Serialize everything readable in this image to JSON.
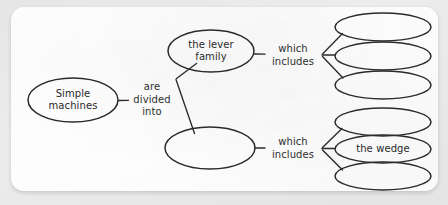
{
  "document": {
    "type": "concept-map-worksheet",
    "paper_color": "#fdfdfd",
    "ink_color": "#2a2a2a",
    "background_color": "#e9e9e9"
  },
  "diagram": {
    "root": {
      "id": "simple-machines",
      "label": "Simple\nmachines",
      "cx": 73,
      "cy": 100,
      "rx": 45,
      "ry": 22,
      "filled": true
    },
    "connectors": [
      {
        "id": "are-divided-into",
        "label": "are\ndivided\ninto",
        "x": 152,
        "y": 100,
        "align": "center"
      },
      {
        "id": "which-includes-top",
        "label": "which\nincludes",
        "x": 296,
        "y": 55,
        "align": "center"
      },
      {
        "id": "which-includes-bottom",
        "label": "which\nincludes",
        "x": 296,
        "y": 148,
        "align": "center"
      }
    ],
    "branches": [
      {
        "id": "lever-family",
        "label": "the lever\nfamily",
        "cx": 211,
        "cy": 51,
        "rx": 43,
        "ry": 21,
        "filled": true,
        "children": [
          {
            "id": "lever-child-1",
            "label": "",
            "cx": 383,
            "cy": 27,
            "rx": 48,
            "ry": 14,
            "filled": false
          },
          {
            "id": "lever-child-2",
            "label": "",
            "cx": 383,
            "cy": 56,
            "rx": 48,
            "ry": 14,
            "filled": false
          },
          {
            "id": "lever-child-3",
            "label": "",
            "cx": 383,
            "cy": 85,
            "rx": 48,
            "ry": 14,
            "filled": false
          }
        ]
      },
      {
        "id": "second-family",
        "label": "",
        "cx": 210,
        "cy": 148,
        "rx": 45,
        "ry": 21,
        "filled": false,
        "children": [
          {
            "id": "second-child-1",
            "label": "",
            "cx": 383,
            "cy": 122,
            "rx": 48,
            "ry": 14,
            "filled": false
          },
          {
            "id": "second-child-2",
            "label": "the wedge",
            "cx": 383,
            "cy": 149,
            "rx": 48,
            "ry": 14,
            "filled": true
          },
          {
            "id": "second-child-3",
            "label": "",
            "cx": 383,
            "cy": 176,
            "rx": 48,
            "ry": 14,
            "filled": false
          }
        ]
      }
    ]
  },
  "labels": {
    "simple_machines": "Simple\nmachines",
    "the_lever_family": "the lever\nfamily",
    "are_divided_into": "are\ndivided\ninto",
    "which_includes_top": "which\nincludes",
    "which_includes_bottom": "which\nincludes",
    "the_wedge": "the wedge",
    "blank": ""
  }
}
